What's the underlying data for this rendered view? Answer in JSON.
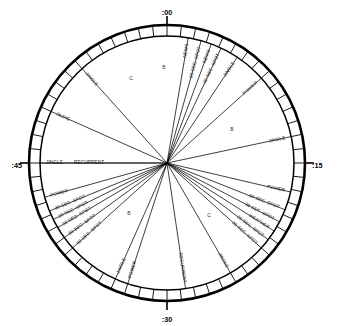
{
  "figure": {
    "type": "radial-clock-diagram",
    "center": {
      "x": 167,
      "y": 163
    },
    "radius_outer": 138,
    "radius_inner": 127,
    "minute_segments": 60,
    "ink_color": "#000000",
    "background_color": "#ffffff"
  },
  "quarter_marks": [
    {
      "label": ":00",
      "minute": 0,
      "x": 167,
      "y": 13,
      "anchor": "middle"
    },
    {
      "label": ":15",
      "minute": 15,
      "x": 312,
      "y": 166,
      "anchor": "start"
    },
    {
      "label": ":30",
      "minute": 30,
      "x": 167,
      "y": 320,
      "anchor": "middle"
    },
    {
      "label": ":45",
      "minute": 45,
      "x": 22,
      "y": 166,
      "anchor": "end"
    }
  ],
  "segment_letters": [
    {
      "label": "B",
      "x": 164,
      "y": 68
    },
    {
      "label": "C",
      "x": 131,
      "y": 79
    },
    {
      "label": "B",
      "x": 232,
      "y": 130
    },
    {
      "label": "C",
      "x": 209,
      "y": 216
    },
    {
      "label": "B",
      "x": 129,
      "y": 214
    }
  ],
  "spokes": [
    {
      "label": "NEWS",
      "minute": 1.6,
      "label_rot": true
    },
    {
      "label": "60 SEC. SPOT",
      "minute": 2.6,
      "label_rot": true
    },
    {
      "label": "NEWS",
      "minute": 3.4,
      "label_rot": true
    },
    {
      "label": "30 SEC. SPOT",
      "minute": 4.2,
      "label_rot": true
    },
    {
      "label": "JINGLE",
      "minute": 5.6,
      "label_rot": true
    },
    {
      "label": "POWER",
      "minute": 8.0,
      "label_rot": true
    },
    {
      "label": "JINGLE",
      "minute": 13.0,
      "label_rot": false
    },
    {
      "label": "POWER",
      "minute": 17.2,
      "label_rot": false
    },
    {
      "label": "60 SEC. SPOT",
      "minute": 18.6,
      "label_rot": false
    },
    {
      "label": "30 SEC. SPOT",
      "minute": 19.6,
      "label_rot": false
    },
    {
      "label": "WEATHER",
      "minute": 20.4,
      "label_rot": false
    },
    {
      "label": "30 SEC. SPOT",
      "minute": 21.2,
      "label_rot": false
    },
    {
      "label": "30 SEC. SPOT",
      "minute": 22.0,
      "label_rot": false
    },
    {
      "label": "JINGLE",
      "minute": 25.0,
      "label_rot": true
    },
    {
      "label": "RECURRENT",
      "minute": 28.6,
      "label_rot": true
    },
    {
      "label": "POWER",
      "minute": 33.0,
      "label_rot": true
    },
    {
      "label": "JINGLE",
      "minute": 34.0,
      "label_rot": true
    },
    {
      "label": "60 SEC. SPOT",
      "minute": 38.0,
      "label_rot": false
    },
    {
      "label": "60 SEC. SPOT",
      "minute": 39.0,
      "label_rot": false
    },
    {
      "label": "30 SEC. SPOT",
      "minute": 39.9,
      "label_rot": false
    },
    {
      "label": "30 SEC. SPOT",
      "minute": 40.6,
      "label_rot": false
    },
    {
      "label": "30 SEC. SPOT",
      "minute": 41.3,
      "label_rot": false
    },
    {
      "label": "POWER",
      "minute": 42.4,
      "label_rot": false
    },
    {
      "label": "JINGLE",
      "minute": 45.0,
      "label_rot": false
    },
    {
      "label": "RECURRENT",
      "minute": 45.0,
      "label_rot": false,
      "stacked_above": true
    },
    {
      "label": "OLDIE",
      "minute": 49.0,
      "label_rot": false
    },
    {
      "label": "JINGLE",
      "minute": 53.0,
      "label_rot": true
    },
    {
      "label": "B",
      "minute": 58.6,
      "label_rot": false,
      "is_letter": true
    }
  ],
  "chart_data": {
    "type": "pie",
    "categories": [
      "NEWS",
      "60 SEC. SPOT",
      "NEWS",
      "30 SEC. SPOT",
      "JINGLE",
      "POWER",
      "JINGLE",
      "POWER",
      "60 SEC. SPOT",
      "30 SEC. SPOT",
      "WEATHER",
      "30 SEC. SPOT",
      "30 SEC. SPOT",
      "JINGLE",
      "RECURRENT",
      "POWER",
      "JINGLE",
      "60 SEC. SPOT",
      "60 SEC. SPOT",
      "30 SEC. SPOT",
      "30 SEC. SPOT",
      "30 SEC. SPOT",
      "POWER",
      "JINGLE",
      "RECURRENT",
      "OLDIE",
      "JINGLE"
    ],
    "axis_ticks": [
      ":00",
      ":15",
      ":30",
      ":45"
    ],
    "xlabel": "minutes of the hour",
    "ylabel": "",
    "grid": false,
    "legend": "none"
  }
}
